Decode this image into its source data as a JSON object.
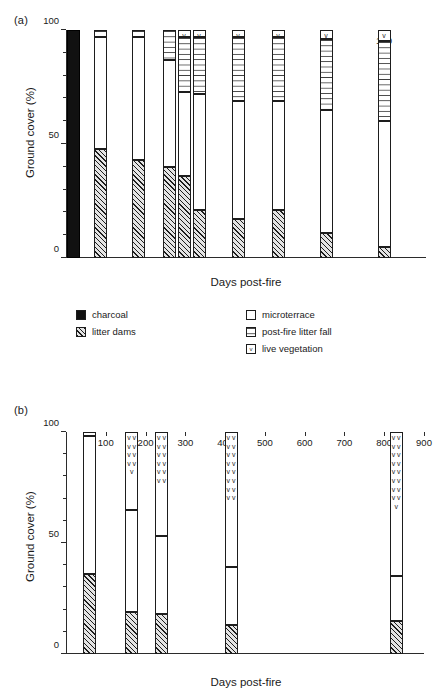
{
  "figure": {
    "panels": [
      {
        "tag": "(a)",
        "ylabel": "Ground cover (%)",
        "xlabel": "Days post-fire",
        "yticks": [
          "0",
          "50",
          "100"
        ]
      },
      {
        "tag": "(b)",
        "ylabel": "Ground cover (%)",
        "xlabel": "Days post-fire",
        "yticks": [
          "0",
          "50",
          "100"
        ]
      }
    ]
  },
  "legend": {
    "left": [
      {
        "key": "charcoal",
        "label": "charcoal"
      },
      {
        "key": "litter_dams",
        "label": "litter dams"
      }
    ],
    "right": [
      {
        "key": "microterrace",
        "label": "microterrace"
      },
      {
        "key": "litter_fall",
        "label": "post-fire litter fall"
      },
      {
        "key": "vegetation",
        "label": "live vegetation"
      }
    ]
  },
  "chart_data": [
    {
      "type": "bar",
      "panel": "(a)",
      "stacked": true,
      "title": "",
      "xlabel": "Days post-fire",
      "ylabel": "Ground cover (%)",
      "ylim": [
        0,
        100
      ],
      "grid": false,
      "legend_position": "below",
      "x_scale": "categorical",
      "categories": [
        "1",
        "14",
        "26",
        "32",
        "35",
        "39",
        "51",
        "63",
        "81",
        "100"
      ],
      "series": [
        {
          "name": "charcoal",
          "values": [
            100,
            0,
            0,
            0,
            0,
            0,
            0,
            0,
            0,
            0
          ]
        },
        {
          "name": "litter dams",
          "values": [
            0,
            48,
            43,
            40,
            36,
            21,
            17,
            21,
            18,
            11,
            5
          ]
        },
        {
          "name": "microterrace",
          "values": [
            0,
            49,
            54,
            47,
            37,
            51,
            52,
            74,
            48,
            54,
            55
          ]
        },
        {
          "name": "post-fire litter fall",
          "values": [
            0,
            3,
            3,
            13,
            24,
            25,
            28,
            2,
            27,
            31,
            35
          ]
        },
        {
          "name": "live vegetation",
          "values": [
            0,
            0,
            0,
            0,
            3,
            3,
            3,
            3,
            3,
            4,
            5
          ]
        }
      ],
      "bars": [
        {
          "x": "1",
          "charcoal": 100,
          "litter_dams": 0,
          "microterrace": 0,
          "litter_fall": 0,
          "vegetation": 0
        },
        {
          "x": "14",
          "charcoal": 0,
          "litter_dams": 48,
          "microterrace": 49,
          "litter_fall": 3,
          "vegetation": 0
        },
        {
          "x": "26",
          "charcoal": 0,
          "litter_dams": 43,
          "microterrace": 54,
          "litter_fall": 3,
          "vegetation": 0
        },
        {
          "x": "32",
          "charcoal": 0,
          "litter_dams": 40,
          "microterrace": 47,
          "litter_fall": 13,
          "vegetation": 0
        },
        {
          "x": "35",
          "charcoal": 0,
          "litter_dams": 36,
          "microterrace": 37,
          "litter_fall": 24,
          "vegetation": 3
        },
        {
          "x": "39",
          "charcoal": 0,
          "litter_dams": 21,
          "microterrace": 51,
          "litter_fall": 25,
          "vegetation": 3
        },
        {
          "x": "51",
          "charcoal": 0,
          "litter_dams": 17,
          "microterrace": 52,
          "litter_fall": 28,
          "vegetation": 3
        },
        {
          "x": "63",
          "charcoal": 0,
          "litter_dams": 21,
          "microterrace": 48,
          "litter_fall": 28,
          "vegetation": 3
        },
        {
          "x": "81",
          "charcoal": 0,
          "litter_dams": 11,
          "microterrace": 54,
          "litter_fall": 31,
          "vegetation": 4
        },
        {
          "x": "100",
          "charcoal": 0,
          "litter_dams": 5,
          "microterrace": 55,
          "litter_fall": 35,
          "vegetation": 5
        }
      ]
    },
    {
      "type": "bar",
      "panel": "(b)",
      "stacked": true,
      "title": "",
      "xlabel": "Days post-fire",
      "ylabel": "Ground cover (%)",
      "ylim": [
        0,
        100
      ],
      "xlim": [
        0,
        900
      ],
      "grid": false,
      "x_scale": "linear",
      "xticks": [
        "100",
        "200",
        "300",
        "400",
        "500",
        "600",
        "700",
        "800",
        "900"
      ],
      "series": [
        {
          "name": "litter dams",
          "values": [
            36,
            19,
            18,
            13,
            15
          ]
        },
        {
          "name": "microterrace",
          "values": [
            62,
            46,
            35,
            26,
            20
          ]
        },
        {
          "name": "post-fire litter fall",
          "values": [
            0,
            0,
            0,
            0,
            0
          ]
        },
        {
          "name": "live vegetation",
          "values": [
            2,
            35,
            47,
            61,
            65
          ]
        }
      ],
      "bars": [
        {
          "x": 60,
          "litter_dams": 36,
          "microterrace": 62,
          "litter_fall": 0,
          "vegetation": 2
        },
        {
          "x": 165,
          "litter_dams": 19,
          "microterrace": 46,
          "litter_fall": 0,
          "vegetation": 35
        },
        {
          "x": 240,
          "litter_dams": 18,
          "microterrace": 35,
          "litter_fall": 0,
          "vegetation": 47
        },
        {
          "x": 415,
          "litter_dams": 13,
          "microterrace": 26,
          "litter_fall": 0,
          "vegetation": 61
        },
        {
          "x": 830,
          "litter_dams": 15,
          "microterrace": 20,
          "litter_fall": 0,
          "vegetation": 65
        }
      ]
    }
  ],
  "colors": {
    "charcoal": "#111111",
    "ink": "#1d1d1d",
    "paper": "#ffffff"
  }
}
